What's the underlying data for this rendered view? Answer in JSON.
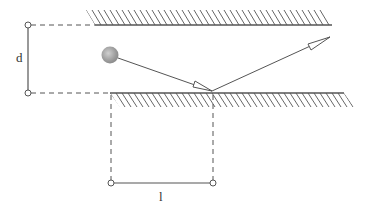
{
  "diagram": {
    "title": "",
    "labels": {
      "separation": "d",
      "horizontal_distance": "l"
    },
    "elements": {
      "top_wall": "hatched plane (upper)",
      "bottom_wall": "hatched plane (lower)",
      "ball": "shaded sphere",
      "incident_ray": "arrow from ball to lower wall",
      "reflected_ray": "arrow reflecting from lower wall toward upper right"
    },
    "colors": {
      "line": "#555555",
      "hatch": "#666666",
      "ball_light": "#c8c8c8",
      "ball_dark": "#8a8a8a",
      "background": "#ffffff"
    }
  }
}
